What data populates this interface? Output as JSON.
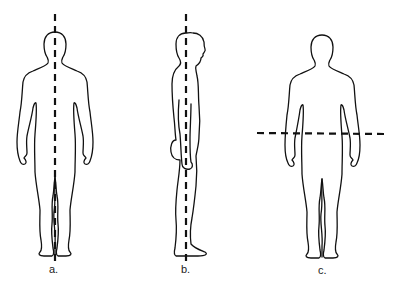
{
  "diagram": {
    "type": "anatomical-planes",
    "figures": [
      {
        "id": "a",
        "label": "a.",
        "view": "anterior (front)",
        "plane": "vertical dashed line through body midline (sagittal plane)",
        "line_orientation": "vertical"
      },
      {
        "id": "b",
        "label": "b.",
        "view": "lateral (side profile, facing right)",
        "plane": "vertical dashed line through side of body (frontal/coronal plane)",
        "line_orientation": "vertical"
      },
      {
        "id": "c",
        "label": "c.",
        "view": "anterior (front)",
        "plane": "horizontal dashed line across waist (transverse plane)",
        "line_orientation": "horizontal"
      }
    ],
    "colors": {
      "background": "#ffffff",
      "outline": "#111111",
      "dashed_line": "#111111",
      "label": "#222222"
    }
  }
}
